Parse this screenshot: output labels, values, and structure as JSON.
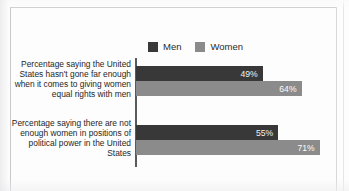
{
  "chart_data": {
    "type": "bar",
    "orientation": "horizontal",
    "title": "",
    "subtitle": "",
    "xlabel": "",
    "ylabel": "",
    "grid": false,
    "legend_position": "top",
    "axis_min": 0,
    "axis_max": 75,
    "value_suffix": "%",
    "categories": [
      "Percentage saying the United States hasn't gone far enough when it comes to giving women equal rights with men",
      "Percentage saying there are not enough women in positions of political power in the United States"
    ],
    "series": [
      {
        "name": "Men",
        "color": "#383838",
        "values": [
          49,
          64
        ]
      },
      {
        "name": "Women",
        "color": "#8b8b8b",
        "values": [
          55,
          71
        ]
      }
    ],
    "bars": [
      {
        "group": 0,
        "series": "Men",
        "value": 49,
        "label": "49%"
      },
      {
        "group": 0,
        "series": "Women",
        "value": 64,
        "label": "64%"
      },
      {
        "group": 1,
        "series": "Men",
        "value": 55,
        "label": "55%"
      },
      {
        "group": 1,
        "series": "Women",
        "value": 71,
        "label": "71%"
      }
    ]
  },
  "legend": {
    "items": [
      {
        "label": "Men",
        "swatch": "men-swatch"
      },
      {
        "label": "Women",
        "swatch": "women-swatch"
      }
    ]
  },
  "labels": {
    "group_0": "Percentage saying the United States hasn't gone far enough when it comes to giving women equal rights with men",
    "group_1": "Percentage saying there are not enough women in positions of political power in the United States"
  },
  "values": {
    "g0_men": "49%",
    "g0_women": "64%",
    "g1_men": "55%",
    "g1_women": "71%"
  },
  "colors": {
    "men": "#383838",
    "women": "#8b8b8b",
    "axis": "#5a5a5a",
    "text": "#1f1f1f",
    "frame": "#c9c9cc",
    "background": "#fdfdfd"
  }
}
